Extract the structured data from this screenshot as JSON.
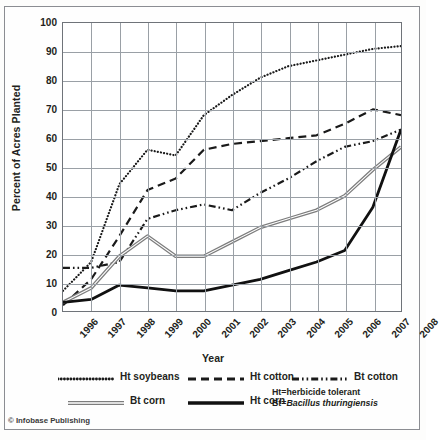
{
  "chart_data": {
    "type": "line",
    "title": "",
    "xlabel": "Year",
    "ylabel": "Percent of Acres Planted",
    "xlim": [
      1996,
      2008
    ],
    "ylim": [
      0,
      100
    ],
    "grid": true,
    "legend_position": "bottom",
    "categories": [
      "1996",
      "1997",
      "1998",
      "1999",
      "2000",
      "2001",
      "2002",
      "2003",
      "2004",
      "2005",
      "2006",
      "2007",
      "2008"
    ],
    "x": [
      1996,
      1997,
      1998,
      1999,
      2000,
      2001,
      2002,
      2003,
      2004,
      2005,
      2006,
      2007,
      2008
    ],
    "yticks": [
      "0",
      "10",
      "20",
      "30",
      "40",
      "50",
      "60",
      "70",
      "80",
      "90",
      "100"
    ],
    "series": [
      {
        "name": "Ht soybeans",
        "style": "dotted",
        "color": "#1a1a1a",
        "values": [
          7,
          17,
          44,
          56,
          54,
          68,
          75,
          81,
          85,
          87,
          89,
          91,
          92
        ]
      },
      {
        "name": "Ht cotton",
        "style": "dashed",
        "color": "#1a1a1a",
        "values": [
          2,
          11,
          26,
          42,
          46,
          56,
          58,
          59,
          60,
          61,
          65,
          70,
          68
        ]
      },
      {
        "name": "Bt cotton",
        "style": "dash-dot-dot",
        "color": "#1a1a1a",
        "values": [
          15,
          15,
          17,
          32,
          35,
          37,
          35,
          41,
          46,
          52,
          57,
          59,
          63
        ]
      },
      {
        "name": "Bt corn",
        "style": "double-gray",
        "color": "#8b8b8b",
        "values": [
          3,
          8,
          19,
          26,
          19,
          19,
          24,
          29,
          32,
          35,
          40,
          49,
          57
        ]
      },
      {
        "name": "Ht corn",
        "style": "solid-thick",
        "color": "#111111",
        "values": [
          3,
          4,
          9,
          8,
          7,
          7,
          9,
          11,
          14,
          17,
          21,
          36,
          63
        ]
      }
    ],
    "annotations": [
      "Ht=herbicide tolerant",
      "Bt=Bacillus thuringiensis"
    ]
  },
  "legend": {
    "items": [
      {
        "label": "Ht soybeans"
      },
      {
        "label": "Ht cotton"
      },
      {
        "label": "Bt cotton"
      },
      {
        "label": "Bt corn"
      },
      {
        "label": "Ht corn"
      }
    ]
  },
  "notes": {
    "line1_prefix": "Ht=herbicide tolerant",
    "line2_prefix": "Bt=",
    "line2_italic": "Bacillus thuringiensis"
  },
  "credit": "© Infobase Publishing"
}
